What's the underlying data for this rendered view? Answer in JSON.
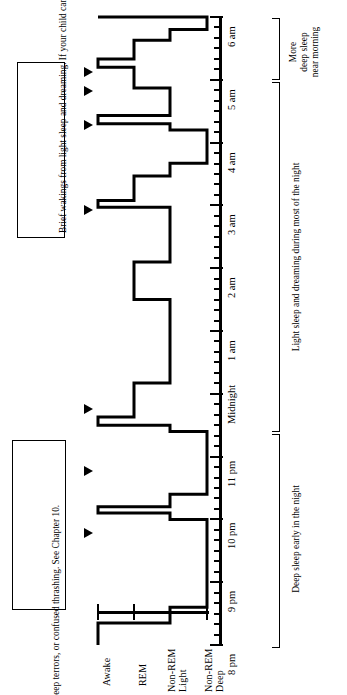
{
  "figure": {
    "orientation": "rotated-90"
  },
  "stage_axis": {
    "label": "Sleep stage",
    "labels": [
      "Awake",
      "REM",
      "Light\nNon-REM",
      "Deep\nNon-REM"
    ],
    "items": [
      {
        "name": "Awake",
        "line1": "Awake",
        "line2": ""
      },
      {
        "name": "REM",
        "line1": "REM",
        "line2": ""
      },
      {
        "name": "Light Non-REM",
        "line1": "Light",
        "line2": "Non-REM"
      },
      {
        "name": "Deep Non-REM",
        "line1": "Deep",
        "line2": "Non-REM"
      }
    ]
  },
  "time_axis": {
    "label": "Time of night",
    "ticks": [
      "8 pm",
      "9 pm",
      "10 pm",
      "11 pm",
      "Midnight",
      "1 am",
      "2 am",
      "3 am",
      "4 am",
      "5 am",
      "6 am"
    ],
    "start": "8 pm",
    "end": "6 am"
  },
  "annotations": {
    "box_top": "Brief wakings from light sleep and dreaming. If your child can't fall back to sleep without your help, see Chapters 5 & 6.",
    "box_bottom": "Brief partial wakings from deep sleep. May be associated with sleep-talking, sleepwalking, sleep terrors, or confused thrashing. See Chapter 10."
  },
  "brackets": [
    {
      "name": "more-deep-sleep-near-morning",
      "label": "More\ndeep sleep\nnear morning",
      "l1": "More",
      "l2": "deep sleep",
      "l3": "near morning",
      "from": "5 am",
      "to": "6 am"
    },
    {
      "name": "light-sleep-most-of-night",
      "label": "Light sleep and dreaming during most of the night",
      "from": "11 pm",
      "to": "5 am"
    },
    {
      "name": "deep-sleep-early-night",
      "label": "Deep sleep early in the night",
      "from": "8 pm",
      "to": "11 pm"
    }
  ],
  "chart_data": {
    "type": "line",
    "xlabel": "Sleep stage",
    "ylabel": "Time of night",
    "grid": false,
    "legend": "none",
    "stages": [
      "Awake",
      "REM",
      "Light Non-REM",
      "Deep Non-REM"
    ],
    "stage_values": {
      "Awake": 0,
      "REM": 1,
      "Light Non-REM": 2,
      "Deep Non-REM": 3
    },
    "time_range": [
      "8 pm",
      "6 am"
    ],
    "time_hours": [
      20,
      30
    ],
    "series": [
      {
        "name": "Sleep stage over the night",
        "points": [
          {
            "time": "8:00 pm",
            "hour": 20.0,
            "stage": "Awake"
          },
          {
            "time": "8:12 pm",
            "hour": 20.2,
            "stage": "Awake"
          },
          {
            "time": "8:20 pm",
            "hour": 20.35,
            "stage": "Light Non-REM"
          },
          {
            "time": "8:35 pm",
            "hour": 20.6,
            "stage": "Deep Non-REM"
          },
          {
            "time": "9:50 pm",
            "hour": 21.85,
            "stage": "Deep Non-REM"
          },
          {
            "time": "10:00 pm",
            "hour": 22.0,
            "stage": "Light Non-REM"
          },
          {
            "time": "10:05 pm",
            "hour": 22.1,
            "stage": "Awake"
          },
          {
            "time": "10:12 pm",
            "hour": 22.2,
            "stage": "Light Non-REM"
          },
          {
            "time": "10:25 pm",
            "hour": 22.4,
            "stage": "Deep Non-REM"
          },
          {
            "time": "11:15 pm",
            "hour": 23.25,
            "stage": "Deep Non-REM"
          },
          {
            "time": "11:25 pm",
            "hour": 23.4,
            "stage": "Light Non-REM"
          },
          {
            "time": "11:30 pm",
            "hour": 23.5,
            "stage": "Awake"
          },
          {
            "time": "11:38 pm",
            "hour": 23.63,
            "stage": "REM"
          },
          {
            "time": "12:05 am",
            "hour": 24.1,
            "stage": "REM"
          },
          {
            "time": "12:10 am",
            "hour": 24.17,
            "stage": "Light Non-REM"
          },
          {
            "time": "1:20 am",
            "hour": 25.33,
            "stage": "Light Non-REM"
          },
          {
            "time": "1:30 am",
            "hour": 25.5,
            "stage": "REM"
          },
          {
            "time": "2:00 am",
            "hour": 26.0,
            "stage": "REM"
          },
          {
            "time": "2:05 am",
            "hour": 26.1,
            "stage": "Light Non-REM"
          },
          {
            "time": "2:50 am",
            "hour": 26.83,
            "stage": "Light Non-REM"
          },
          {
            "time": "2:58 am",
            "hour": 26.97,
            "stage": "Awake"
          },
          {
            "time": "3:05 am",
            "hour": 27.08,
            "stage": "REM"
          },
          {
            "time": "3:20 am",
            "hour": 27.33,
            "stage": "REM"
          },
          {
            "time": "3:28 am",
            "hour": 27.47,
            "stage": "Light Non-REM"
          },
          {
            "time": "3:40 am",
            "hour": 27.67,
            "stage": "Deep Non-REM"
          },
          {
            "time": "4:05 am",
            "hour": 28.08,
            "stage": "Deep Non-REM"
          },
          {
            "time": "4:12 am",
            "hour": 28.2,
            "stage": "Light Non-REM"
          },
          {
            "time": "4:18 am",
            "hour": 28.3,
            "stage": "Awake"
          },
          {
            "time": "4:26 am",
            "hour": 28.43,
            "stage": "Light Non-REM"
          },
          {
            "time": "4:45 am",
            "hour": 28.75,
            "stage": "Light Non-REM"
          },
          {
            "time": "4:52 am",
            "hour": 28.87,
            "stage": "REM"
          },
          {
            "time": "5:05 am",
            "hour": 29.08,
            "stage": "REM"
          },
          {
            "time": "5:12 am",
            "hour": 29.2,
            "stage": "Awake"
          },
          {
            "time": "5:20 am",
            "hour": 29.33,
            "stage": "REM"
          },
          {
            "time": "5:32 am",
            "hour": 29.53,
            "stage": "REM"
          },
          {
            "time": "5:38 am",
            "hour": 29.63,
            "stage": "Light Non-REM"
          },
          {
            "time": "5:48 am",
            "hour": 29.8,
            "stage": "Deep Non-REM"
          },
          {
            "time": "6:00 am",
            "hour": 30.0,
            "stage": "Awake"
          }
        ]
      }
    ],
    "wake_markers": [
      {
        "name": "arrow-wake-1",
        "time": "10:05 pm",
        "hour": 22.1,
        "type": "partial waking from deep sleep"
      },
      {
        "name": "arrow-wake-2",
        "time": "11:30 pm",
        "hour": 23.5,
        "type": "partial waking from deep sleep"
      },
      {
        "name": "arrow-wake-3",
        "time": "2:58 am",
        "hour": 26.97,
        "type": "brief waking from light sleep"
      },
      {
        "name": "arrow-wake-4",
        "time": "4:18 am",
        "hour": 28.3,
        "type": "brief waking from light sleep"
      },
      {
        "name": "arrow-wake-5",
        "time": "5:12 am",
        "hour": 29.2,
        "type": "brief waking from light sleep"
      },
      {
        "name": "arrow-wake-6",
        "time": "5:32 am",
        "hour": 29.53,
        "type": "brief waking from light sleep"
      }
    ]
  }
}
